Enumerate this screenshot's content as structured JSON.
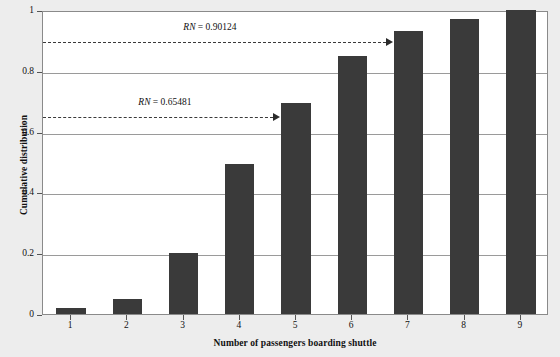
{
  "chart_data": {
    "type": "bar",
    "title": "",
    "xlabel": "Number of passengers boarding shuttle",
    "ylabel": "Cumulative distribution",
    "categories": [
      "1",
      "2",
      "3",
      "4",
      "5",
      "6",
      "7",
      "8",
      "9"
    ],
    "values": [
      0.02,
      0.05,
      0.2,
      0.495,
      0.695,
      0.85,
      0.93,
      0.97,
      1.0
    ],
    "xlim": [
      0.5,
      9.5
    ],
    "ylim": [
      0,
      1
    ],
    "ytick_labels": [
      "0",
      "0.2",
      "0.4",
      "0.6",
      "0.8",
      "1"
    ],
    "ytick_values": [
      0,
      0.2,
      0.4,
      0.6,
      0.8,
      1
    ],
    "xtick_labels": [
      "1",
      "2",
      "3",
      "4",
      "5",
      "6",
      "7",
      "8",
      "9"
    ],
    "grid": "horizontal",
    "legend": "none",
    "bar_color": "#3a3a3a",
    "plot_background": "#ffffff",
    "figure_background": "#ededed",
    "gridline_color": "#9a9a9a",
    "annotations": [
      {
        "id": "rn-upper",
        "prefix": "RN",
        "equals": " = ",
        "value": "0.90124",
        "label": "RN = 0.90124",
        "y_value": 0.9,
        "arrow_to_category": "7",
        "style": "dashed-arrow"
      },
      {
        "id": "rn-lower",
        "prefix": "RN",
        "equals": " = ",
        "value": "0.65481",
        "label": "RN = 0.65481",
        "y_value": 0.655,
        "arrow_to_category": "5",
        "style": "dashed-arrow"
      }
    ]
  }
}
